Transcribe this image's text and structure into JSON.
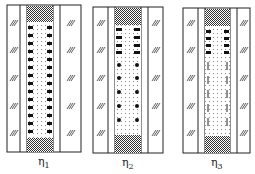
{
  "figure": {
    "panels": [
      {
        "id": "eta1",
        "label_symbol": "η",
        "label_sub": "1",
        "state": "dense crossbars throughout"
      },
      {
        "id": "eta2",
        "label_symbol": "η",
        "label_sub": "2",
        "state": "crossbars top, blobs below"
      },
      {
        "id": "eta3",
        "label_symbol": "η",
        "label_sub": "3",
        "state": "crossbars top, thin dashes below"
      }
    ],
    "colors": {
      "line": "#222222",
      "fill": "#ffffff",
      "stipple": "#555555"
    }
  }
}
